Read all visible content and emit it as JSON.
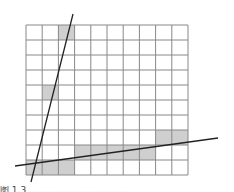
{
  "diagram": {
    "grid": {
      "cols": 10,
      "rows": 10,
      "x": 26,
      "y": 25,
      "width": 162,
      "height": 150,
      "line_color": "#888888",
      "fill_color": "#cfcfcf"
    },
    "shaded_cells": [
      {
        "row": 0,
        "col": 2
      },
      {
        "row": 4,
        "col": 1
      },
      {
        "row": 7,
        "col": 8
      },
      {
        "row": 7,
        "col": 9
      },
      {
        "row": 8,
        "col": 3
      },
      {
        "row": 8,
        "col": 4
      },
      {
        "row": 8,
        "col": 5
      },
      {
        "row": 8,
        "col": 6
      },
      {
        "row": 8,
        "col": 7
      },
      {
        "row": 9,
        "col": 0
      },
      {
        "row": 9,
        "col": 1
      },
      {
        "row": 9,
        "col": 2
      }
    ],
    "lines": [
      {
        "name": "steep-line",
        "x1": 31,
        "y1": 182,
        "x2": 73,
        "y2": 14,
        "color": "#222222"
      },
      {
        "name": "shallow-line",
        "x1": 15,
        "y1": 166,
        "x2": 218,
        "y2": 138,
        "color": "#222222"
      }
    ],
    "caption": "图 1.3  .................................."
  }
}
